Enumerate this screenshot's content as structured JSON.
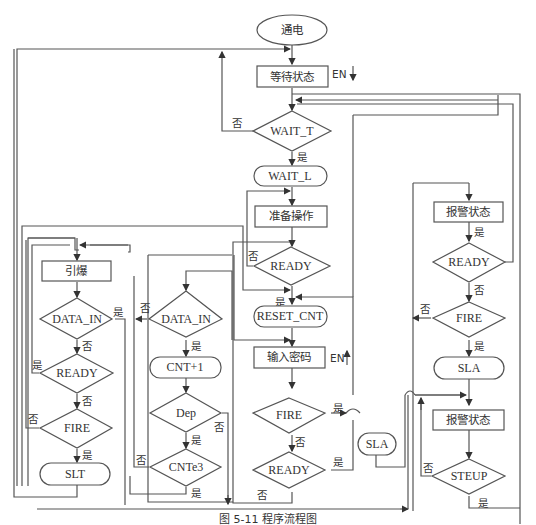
{
  "caption": "图 5-11 程序流程图",
  "nodes": {
    "power_on": "通电",
    "wait_state": "等待状态",
    "wait_t": "WAIT_T",
    "wait_l": "WAIT_L",
    "prepare": "准备操作",
    "ready_main": "READY",
    "reset_cnt": "RESET_CNT",
    "input_pwd": "输入密码",
    "fire_main": "FIRE",
    "ready_main2": "READY",
    "sla_mid": "SLA",
    "detonate": "引爆",
    "data_in_left": "DATA_IN",
    "ready_left": "READY",
    "fire_left": "FIRE",
    "slt": "SLT",
    "data_in_mid": "DATA_IN",
    "cnt_inc": "CNT+1",
    "dep": "Dep",
    "cnte3": "CNTe3",
    "alarm_state_1": "报警状态",
    "ready_right": "READY",
    "fire_right": "FIRE",
    "sla_right": "SLA",
    "alarm_state_2": "报警状态",
    "steup": "STEUP"
  },
  "labels": {
    "yes": "是",
    "no": "否",
    "en": "EN"
  }
}
